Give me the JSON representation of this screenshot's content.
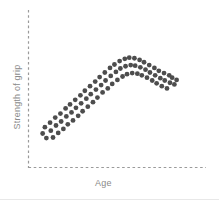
{
  "chart_data": {
    "type": "scatter",
    "title": "",
    "subtitle": "",
    "xlabel": "Age",
    "ylabel": "Strength of grip",
    "grid": false,
    "legend": null,
    "annotations": [],
    "axis_style": "dashed",
    "axis_color": "#9a9a9a",
    "point_color": "#4d4d4d",
    "point_radius_px": 2.4,
    "xlim": [
      0,
      100
    ],
    "ylim": [
      0,
      100
    ],
    "xticks": [],
    "yticks": [],
    "points": [
      [
        4.5,
        21.5
      ],
      [
        6.0,
        27.0
      ],
      [
        7.0,
        17.5
      ],
      [
        9.5,
        31.0
      ],
      [
        10.0,
        24.0
      ],
      [
        11.5,
        18.0
      ],
      [
        13.0,
        35.5
      ],
      [
        13.5,
        28.5
      ],
      [
        15.0,
        22.0
      ],
      [
        16.5,
        39.0
      ],
      [
        17.0,
        32.0
      ],
      [
        18.5,
        25.5
      ],
      [
        20.0,
        43.5
      ],
      [
        20.5,
        36.5
      ],
      [
        21.5,
        29.5
      ],
      [
        23.0,
        47.0
      ],
      [
        24.0,
        40.0
      ],
      [
        25.0,
        33.0
      ],
      [
        26.5,
        51.0
      ],
      [
        27.0,
        44.0
      ],
      [
        28.5,
        37.0
      ],
      [
        30.0,
        55.0
      ],
      [
        30.5,
        48.0
      ],
      [
        31.5,
        41.0
      ],
      [
        33.0,
        59.0
      ],
      [
        34.0,
        52.0
      ],
      [
        35.0,
        45.0
      ],
      [
        36.5,
        63.0
      ],
      [
        37.0,
        56.0
      ],
      [
        38.5,
        49.0
      ],
      [
        40.0,
        67.0
      ],
      [
        40.5,
        60.0
      ],
      [
        41.5,
        53.0
      ],
      [
        43.0,
        71.0
      ],
      [
        44.0,
        64.0
      ],
      [
        45.0,
        57.5
      ],
      [
        46.5,
        75.0
      ],
      [
        47.0,
        68.0
      ],
      [
        48.5,
        61.0
      ],
      [
        50.0,
        79.0
      ],
      [
        50.5,
        72.0
      ],
      [
        51.5,
        65.0
      ],
      [
        53.0,
        82.0
      ],
      [
        54.0,
        75.5
      ],
      [
        55.0,
        68.5
      ],
      [
        56.5,
        85.0
      ],
      [
        57.0,
        78.5
      ],
      [
        58.5,
        71.5
      ],
      [
        60.0,
        87.0
      ],
      [
        60.5,
        80.5
      ],
      [
        61.5,
        73.5
      ],
      [
        63.0,
        88.0
      ],
      [
        64.0,
        81.5
      ],
      [
        65.0,
        74.5
      ],
      [
        66.5,
        87.5
      ],
      [
        67.0,
        81.0
      ],
      [
        68.5,
        74.0
      ],
      [
        70.0,
        86.0
      ],
      [
        70.5,
        79.5
      ],
      [
        71.5,
        72.5
      ],
      [
        73.0,
        84.0
      ],
      [
        74.0,
        77.5
      ],
      [
        75.0,
        70.5
      ],
      [
        76.5,
        81.5
      ],
      [
        77.0,
        75.0
      ],
      [
        78.5,
        68.0
      ],
      [
        80.0,
        79.0
      ],
      [
        80.5,
        72.5
      ],
      [
        81.5,
        65.5
      ],
      [
        83.0,
        76.5
      ],
      [
        84.0,
        70.0
      ],
      [
        85.0,
        63.0
      ],
      [
        86.5,
        74.5
      ],
      [
        87.0,
        68.0
      ],
      [
        88.5,
        61.0
      ],
      [
        90.0,
        72.5
      ],
      [
        90.5,
        66.0
      ],
      [
        92.0,
        70.5
      ],
      [
        93.5,
        64.5
      ],
      [
        95.0,
        68.5
      ]
    ]
  },
  "axes": {
    "y_axis_label": "Strength of grip",
    "x_axis_label": "Age"
  }
}
